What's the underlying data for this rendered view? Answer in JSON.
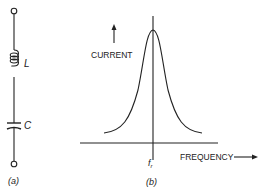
{
  "figure": {
    "part_a": {
      "caption": "(a)",
      "components": [
        {
          "type": "inductor",
          "label": "L"
        },
        {
          "type": "capacitor",
          "label": "C"
        }
      ]
    },
    "part_b": {
      "caption": "(b)",
      "y_axis_label": "CURRENT",
      "x_axis_label": "FREQUENCY",
      "marker_label": "f",
      "marker_subscript": "r",
      "curve": "resonance peak centered at resonant frequency"
    },
    "colors": {
      "ink": "#222222",
      "background": "#ffffff"
    }
  }
}
